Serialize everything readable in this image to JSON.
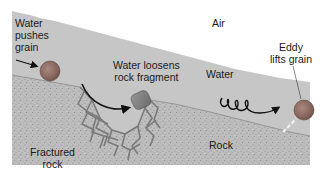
{
  "diagram": {
    "colors": {
      "background": "#ffffff",
      "air": "#ffffff",
      "water": "#c4c4c4",
      "rock": "#b8b8b8",
      "rock_speckle": "#8e8e8e",
      "fracture": "#7a7a7a",
      "grain": "#8a6a62",
      "grain_highlight": "#9e7f76",
      "fragment": "#7f7f7f",
      "arrow": "#111111",
      "eddy_lift": "#f2f2f2",
      "text": "#1a1a1a"
    },
    "labels": {
      "air": "Air",
      "water": "Water",
      "rock": "Rock",
      "fractured_rock_line1": "Fractured",
      "fractured_rock_line2": "rock",
      "water_pushes_line1": "Water",
      "water_pushes_line2": "pushes",
      "water_pushes_line3": "grain",
      "water_loosens_line1": "Water loosens",
      "water_loosens_line2": "rock fragment",
      "eddy_line1": "Eddy",
      "eddy_line2": "lifts grain"
    },
    "regions": [
      {
        "name": "air",
        "label": "Air"
      },
      {
        "name": "water",
        "label": "Water"
      },
      {
        "name": "rock",
        "label": "Rock"
      },
      {
        "name": "fractured-rock",
        "label": "Fractured rock"
      }
    ],
    "processes": [
      {
        "name": "water-pushes-grain",
        "label": "Water pushes grain"
      },
      {
        "name": "water-loosens-rock-fragment",
        "label": "Water loosens rock fragment"
      },
      {
        "name": "eddy-lifts-grain",
        "label": "Eddy lifts grain"
      }
    ]
  }
}
